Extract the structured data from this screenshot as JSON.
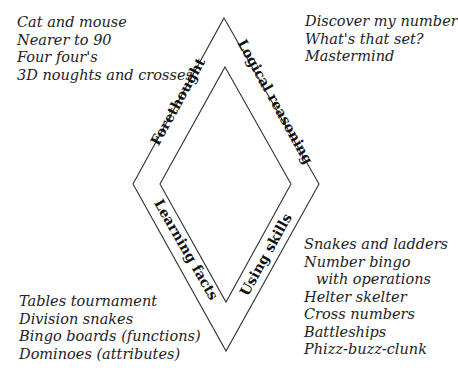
{
  "diagram": {
    "type": "diamond-band",
    "outer_diamond": {
      "top": [
        224,
        18
      ],
      "right": [
        319,
        184
      ],
      "bottom": [
        226,
        351
      ],
      "left": [
        133,
        184
      ]
    },
    "inner_diamond": {
      "top": [
        225,
        67
      ],
      "right": [
        291,
        184
      ],
      "bottom": [
        226,
        302
      ],
      "left": [
        160,
        184
      ]
    },
    "stroke_color": "#333333",
    "text_color": "#222222",
    "bands": [
      {
        "id": "forethought",
        "label": "Forethought",
        "side": "top-left"
      },
      {
        "id": "logical",
        "label": "Logical reasoning",
        "side": "top-right"
      },
      {
        "id": "learning",
        "label": "Learning facts",
        "side": "bottom-left"
      },
      {
        "id": "skills",
        "label": "Using skills",
        "side": "bottom-right"
      }
    ]
  },
  "lists": {
    "forethought": [
      "Cat and mouse",
      "Nearer to 90",
      "Four four's",
      "3D noughts and crosses"
    ],
    "logical": [
      "Discover my number",
      "What's that set?",
      "Mastermind"
    ],
    "learning": [
      "Tables tournament",
      "Division snakes",
      "Bingo boards (functions)",
      "Dominoes (attributes)"
    ],
    "skills": [
      "Snakes and ladders",
      "Number bingo",
      "with operations",
      "Helter skelter",
      "Cross numbers",
      "Battleships",
      "Phizz-buzz-clunk"
    ]
  }
}
